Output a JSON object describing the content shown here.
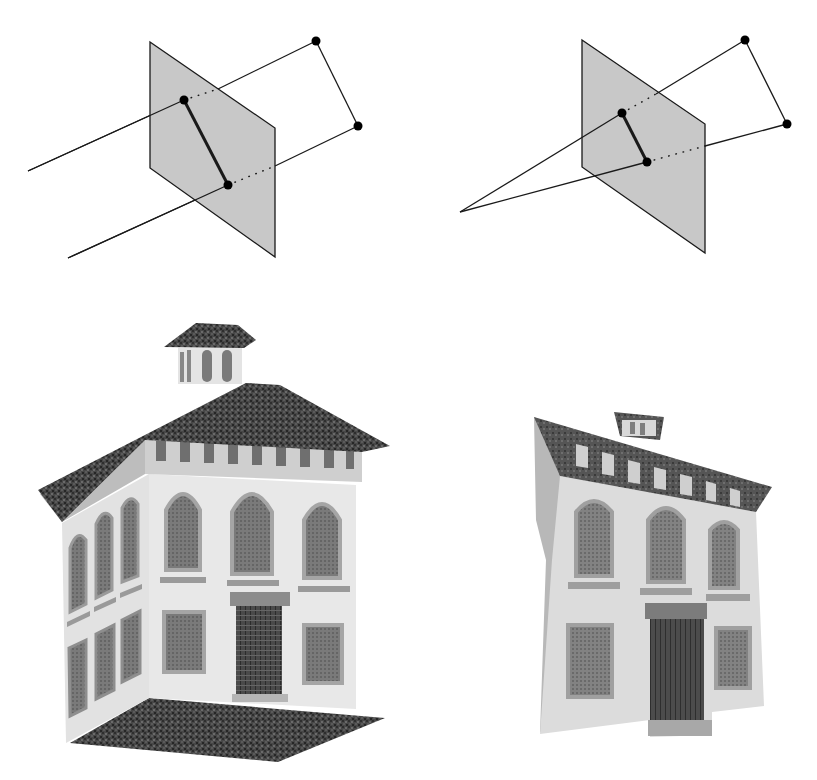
{
  "figure": {
    "colors": {
      "background": "#ffffff",
      "plane_fill": "#c8c8c8",
      "stroke": "#1a1a1a",
      "roof": "#4a4a4a",
      "roof_dark": "#333333",
      "wall_light": "#e6e6e6",
      "wall_mid": "#d2d2d2",
      "wall_shade": "#bcbcbc",
      "window": "#7c7c7c",
      "window_dark": "#5c5c5c",
      "trim": "#a9a9a9",
      "door": "#4c4c4c",
      "ground": "#3d3d3d"
    },
    "parallel_projection": {
      "plane": [
        [
          150,
          42
        ],
        [
          275,
          128
        ],
        [
          275,
          257
        ],
        [
          150,
          168
        ]
      ],
      "image_points": [
        [
          184,
          100
        ],
        [
          228,
          185
        ]
      ],
      "world_points": [
        [
          316,
          41
        ],
        [
          358,
          126
        ]
      ],
      "ray_starts": [
        [
          28,
          171
        ],
        [
          68,
          258
        ]
      ],
      "ray_exits": [
        [
          218,
          89
        ],
        [
          275,
          166
        ]
      ]
    },
    "perspective_projection": {
      "plane": [
        [
          582,
          40
        ],
        [
          705,
          124
        ],
        [
          705,
          253
        ],
        [
          582,
          167
        ]
      ],
      "image_points": [
        [
          622,
          113
        ],
        [
          647,
          162
        ]
      ],
      "world_points": [
        [
          745,
          40
        ],
        [
          787,
          124
        ]
      ],
      "center_of_projection": [
        460,
        212
      ],
      "ray_exits": [
        [
          656,
          94
        ],
        [
          705,
          146
        ]
      ]
    },
    "house_left": {
      "label": "original view"
    },
    "house_right": {
      "label": "reprojected view"
    }
  }
}
